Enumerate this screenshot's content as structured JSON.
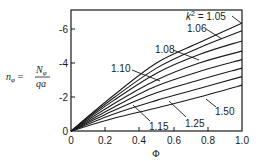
{
  "chart_data": {
    "type": "line",
    "title": "",
    "xlabel": "Φ",
    "ylabel": "n_φ = N_φ / qa",
    "ylabel_parts": {
      "lhs": "n",
      "lhs_sub": "φ",
      "num": "N",
      "num_sub": "φ",
      "den": "qa"
    },
    "xlim": [
      0,
      1.0
    ],
    "ylim": [
      0,
      -7
    ],
    "x_ticks": [
      "0",
      "0.2",
      "0.4",
      "0.6",
      "0.8",
      "1.0"
    ],
    "y_ticks": [
      "0",
      "-2",
      "-4",
      "-6"
    ],
    "grid": false,
    "legend": "inline labels with leader lines",
    "x": [
      0,
      0.25,
      0.5,
      0.75,
      1.0
    ],
    "series": [
      {
        "name": "k² = 1.05",
        "label": "k² = 1.05",
        "values": [
          0,
          -2.1,
          -4.0,
          -5.2,
          -6.35
        ]
      },
      {
        "name": "1.06",
        "label": "1.06",
        "values": [
          0,
          -1.95,
          -3.7,
          -4.9,
          -5.9
        ]
      },
      {
        "name": "1.08",
        "label": "1.08",
        "values": [
          0,
          -1.8,
          -3.4,
          -4.5,
          -5.3
        ]
      },
      {
        "name": "1.10",
        "label": "1.10",
        "values": [
          0,
          -1.6,
          -3.0,
          -4.0,
          -4.7
        ]
      },
      {
        "name": "unlabeled",
        "label": "",
        "values": [
          0,
          -1.4,
          -2.65,
          -3.5,
          -4.2
        ]
      },
      {
        "name": "1.15",
        "label": "1.15",
        "values": [
          0,
          -1.2,
          -2.25,
          -3.0,
          -3.7
        ]
      },
      {
        "name": "1.25",
        "label": "1.25",
        "values": [
          0,
          -1.0,
          -1.8,
          -2.5,
          -3.2
        ]
      },
      {
        "name": "1.50",
        "label": "1.50",
        "values": [
          0,
          -0.75,
          -1.35,
          -2.0,
          -2.7
        ]
      }
    ]
  },
  "labels": {
    "k2_prefix": "k",
    "k2_sup": "2",
    "k2_eq": " = 1.05",
    "l106": "1.06",
    "l108": "1.08",
    "l110": "1.10",
    "l115": "1.15",
    "l125": "1.25",
    "l150": "1.50"
  },
  "colors": {
    "ink": "#1a1a1a",
    "background": "#ffffff"
  }
}
